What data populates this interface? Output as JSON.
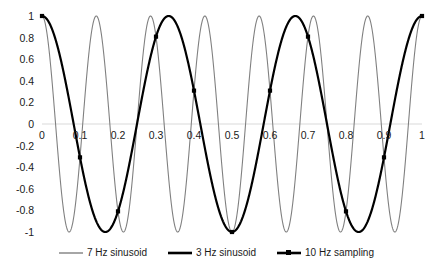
{
  "chart_data": {
    "type": "line",
    "title": "",
    "xlabel": "",
    "ylabel": "",
    "xlim": [
      0,
      1
    ],
    "ylim": [
      -1,
      1
    ],
    "grid": false,
    "zero_line": true,
    "legend_position": "bottom",
    "x_ticks": [
      "0",
      "0.1",
      "0.2",
      "0.3",
      "0.4",
      "0.5",
      "0.6",
      "0.7",
      "0.8",
      "0.9",
      "1"
    ],
    "x_tick_values": [
      0,
      0.1,
      0.2,
      0.3,
      0.4,
      0.5,
      0.6,
      0.7,
      0.8,
      0.9,
      1
    ],
    "y_ticks": [
      "1",
      "0.8",
      "0.6",
      "0.4",
      "0.2",
      "0",
      "-0.2",
      "-0.4",
      "-0.6",
      "-0.8",
      "-1"
    ],
    "y_tick_values": [
      1,
      0.8,
      0.6,
      0.4,
      0.2,
      0,
      -0.2,
      -0.4,
      -0.6,
      -0.8,
      -1
    ],
    "series": [
      {
        "name": "7 Hz sinusoid",
        "style": "line",
        "color": "#808080",
        "width": 1.1,
        "formula": "cos(2*pi*7*t)",
        "frequency_hz": 7,
        "markers": false
      },
      {
        "name": "3 Hz sinusoid",
        "style": "line",
        "color": "#000000",
        "width": 2.2,
        "formula": "cos(2*pi*3*t)",
        "frequency_hz": 3,
        "markers": false
      },
      {
        "name": "10 Hz sampling",
        "style": "line-marker",
        "color": "#000000",
        "width": 2.2,
        "frequency_hz": 10,
        "markers": true,
        "x": [
          0,
          0.1,
          0.2,
          0.3,
          0.4,
          0.5,
          0.6,
          0.7,
          0.8,
          0.9,
          1
        ],
        "values": [
          1,
          -0.309,
          -0.809,
          0.809,
          0.309,
          -1,
          0.309,
          0.809,
          -0.809,
          -0.309,
          1
        ]
      }
    ]
  },
  "legend": {
    "items": [
      {
        "label": "7 Hz sinusoid",
        "color": "#808080",
        "width": 1.4,
        "marker": false
      },
      {
        "label": "3 Hz sinusoid",
        "color": "#000000",
        "width": 2.6,
        "marker": false
      },
      {
        "label": "10 Hz sampling",
        "color": "#000000",
        "width": 2.6,
        "marker": true
      }
    ]
  },
  "colors": {
    "background": "#ffffff",
    "axis_text": "#1a1a1a",
    "zero_line": "#d9d9d9",
    "gray_series": "#808080",
    "black_series": "#000000"
  }
}
